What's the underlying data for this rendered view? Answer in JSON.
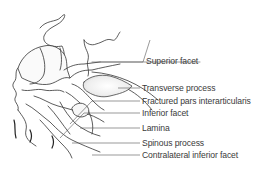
{
  "figure": {
    "labels": [
      {
        "text": "Superior facet",
        "x": 144,
        "y": 57
      },
      {
        "text": "Transverse process",
        "x": 143,
        "y": 85
      },
      {
        "text": "Fractured pars interarticularis",
        "x": 143,
        "y": 98
      },
      {
        "text": "Inferior facet",
        "x": 143,
        "y": 110
      },
      {
        "text": "Lamina",
        "x": 143,
        "y": 125
      },
      {
        "text": "Spinous process",
        "x": 143,
        "y": 140
      },
      {
        "text": "Contralateral inferior facet",
        "x": 143,
        "y": 152
      }
    ]
  }
}
